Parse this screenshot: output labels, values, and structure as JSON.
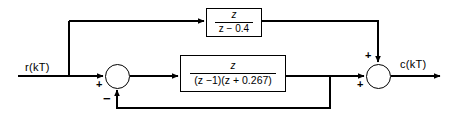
{
  "diagram": {
    "input_label": "r(kT)",
    "output_label": "c(kT)",
    "blocks": [
      {
        "id": "feedforward",
        "name": "top-transfer-function-block",
        "numerator": "z",
        "denominator": "z − 0.4",
        "expression": "z/(z-0.4)"
      },
      {
        "id": "forward-path",
        "name": "forward-path-transfer-function-block",
        "numerator": "z",
        "denominator": "(z −1)(z + 0.267)",
        "expression": "z/((z-1)(z+0.267))"
      }
    ],
    "summing_junctions": [
      {
        "id": "left",
        "name": "left-summing-junction",
        "signs": {
          "left_input": "+",
          "bottom_input": "−"
        }
      },
      {
        "id": "right",
        "name": "right-summing-junction",
        "signs": {
          "top_input": "+",
          "left_input": "+"
        }
      }
    ],
    "colors": {
      "line": "#000000",
      "background": "#ffffff"
    }
  }
}
